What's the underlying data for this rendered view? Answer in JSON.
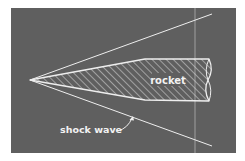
{
  "figure": {
    "type": "diagram",
    "colors": {
      "page_background": "#ffffff",
      "panel_background": "#5f5f5f",
      "lines": "#eeeeee",
      "hatch": "#d8d8d8"
    },
    "labels": {
      "rocket": "rocket",
      "shock_wave": "shock wave"
    }
  }
}
